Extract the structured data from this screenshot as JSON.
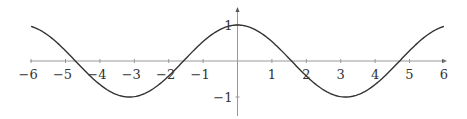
{
  "chart_data": {
    "type": "line",
    "title": "",
    "xlabel": "",
    "ylabel": "",
    "xlim": [
      -6,
      6
    ],
    "ylim": [
      -1,
      1
    ],
    "grid": false,
    "legend": null,
    "series": [
      {
        "name": "cos(x)",
        "function": "cos(x)",
        "x_range": [
          -6,
          6
        ],
        "key_points": [
          {
            "x": -6,
            "y": 0.96
          },
          {
            "x": -4.71,
            "y": 0
          },
          {
            "x": -3.14,
            "y": -1
          },
          {
            "x": -1.57,
            "y": 0
          },
          {
            "x": 0,
            "y": 1
          },
          {
            "x": 1.57,
            "y": 0
          },
          {
            "x": 3.14,
            "y": -1
          },
          {
            "x": 4.71,
            "y": 0
          },
          {
            "x": 6,
            "y": 0.96
          }
        ]
      }
    ],
    "x_ticks": [
      "−6",
      "−5",
      "−4",
      "−3",
      "−2",
      "−1",
      "1",
      "2",
      "3",
      "4",
      "5",
      "6"
    ],
    "x_tick_values": [
      -6,
      -5,
      -4,
      -3,
      -2,
      -1,
      1,
      2,
      3,
      4,
      5,
      6
    ],
    "y_ticks": [
      "1",
      "−1"
    ],
    "y_tick_values": [
      1,
      -1
    ]
  },
  "colors": {
    "axis": "#999999",
    "curve": "#333333",
    "text": "#333333"
  }
}
